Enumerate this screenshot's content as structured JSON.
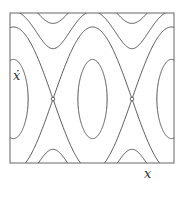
{
  "figure": {
    "type": "phase-portrait",
    "axis_labels": {
      "x": "x",
      "y": "ẋ"
    },
    "frame": {
      "left": 10,
      "top": 13,
      "right": 174,
      "bottom": 163
    },
    "center": {
      "cx": 92.5,
      "cy": 99
    },
    "scale": {
      "px_per_rad": 12.57,
      "px_per_unit": 36
    },
    "saddles": [
      {
        "x": 53,
        "y": 99
      },
      {
        "x": 132,
        "y": 99
      }
    ],
    "energy_levels_closed": [
      0.55
    ],
    "energy_levels_rotating": [
      1.22,
      1.45,
      1.62
    ],
    "separatrix_energy": 1.0,
    "line_color": "#444444",
    "frame_color": "#666666"
  }
}
